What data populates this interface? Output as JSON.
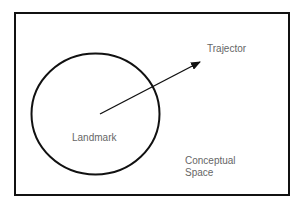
{
  "diagram": {
    "frame_label": "Conceptual Space",
    "labels": {
      "trajector": "Trajector",
      "landmark": "Landmark",
      "space_line1": "Conceptual",
      "space_line2": "Space"
    },
    "colors": {
      "stroke": "#111111",
      "text": "#666666",
      "background": "#ffffff"
    }
  }
}
